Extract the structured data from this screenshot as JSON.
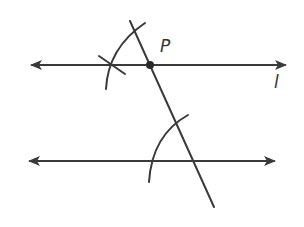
{
  "diagram": {
    "colors": {
      "stroke": "#3a3a3a",
      "point": "#2a2a2a",
      "background": "#ffffff"
    },
    "labels": {
      "point": "P",
      "line": "l"
    },
    "elements": {
      "line_l": {
        "x1": 30,
        "y1": 65,
        "x2": 287,
        "y2": 65,
        "arrows": "both"
      },
      "parallel_line": {
        "x1": 28,
        "y1": 161,
        "x2": 276,
        "y2": 161,
        "arrows": "both"
      },
      "transversal": {
        "x1": 130,
        "y1": 21,
        "x2": 214,
        "y2": 207
      },
      "point_P": {
        "x": 150,
        "y": 65
      },
      "arc_top": "compass arc at P",
      "arc_bottom": "compass arc at intersection"
    }
  }
}
